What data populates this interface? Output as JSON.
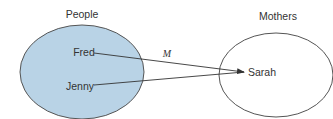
{
  "diagram": {
    "sets": [
      {
        "label": "People",
        "fill": "#b9d3e6",
        "stroke": "#555555",
        "members": [
          "Fred",
          "Jenny"
        ]
      },
      {
        "label": "Mothers",
        "fill": "#ffffff",
        "stroke": "#555555",
        "members": [
          "Sarah"
        ]
      }
    ],
    "mapping_label": "M",
    "arrows": [
      {
        "from": "Fred",
        "to": "Sarah"
      },
      {
        "from": "Jenny",
        "to": "Sarah"
      }
    ]
  }
}
